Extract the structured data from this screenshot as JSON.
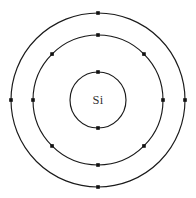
{
  "diagram": {
    "type": "bohr-atomic-model",
    "canvas": {
      "width": 196,
      "height": 198,
      "background": "#ffffff"
    },
    "center": {
      "x": 98,
      "y": 100
    },
    "nucleus": {
      "label": "Si",
      "element_name": "Silicon",
      "label_color": "#333333"
    },
    "stroke_color": "#1a1a1a",
    "electron_color": "#111111",
    "electron_size": 3.6,
    "total_electrons": 14,
    "electron_configuration": "2-8-4",
    "shells": [
      {
        "name": "K-shell",
        "index": 1,
        "radius": 28,
        "electron_count": 2,
        "angles": [
          90,
          270
        ]
      },
      {
        "name": "L-shell",
        "index": 2,
        "radius": 65,
        "electron_count": 8,
        "angles": [
          0,
          45,
          90,
          135,
          180,
          225,
          270,
          315
        ]
      },
      {
        "name": "M-shell",
        "index": 3,
        "radius": 87,
        "electron_count": 4,
        "angles": [
          0,
          90,
          180,
          270
        ]
      }
    ]
  }
}
